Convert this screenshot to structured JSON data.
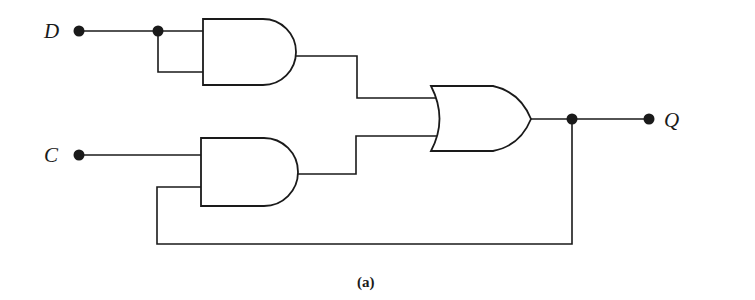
{
  "figure": {
    "caption": "(a)",
    "inputs": [
      {
        "name": "D",
        "label": "D"
      },
      {
        "name": "C",
        "label": "C"
      }
    ],
    "outputs": [
      {
        "name": "Q",
        "label": "Q"
      }
    ],
    "gates": [
      {
        "id": "and1",
        "type": "AND",
        "inputs": [
          "D",
          "D"
        ]
      },
      {
        "id": "and2",
        "type": "AND",
        "inputs": [
          "C",
          "Q"
        ]
      },
      {
        "id": "or1",
        "type": "OR",
        "inputs": [
          "and1",
          "and2"
        ],
        "output": "Q"
      }
    ],
    "feedback": "Q fed back to AND2 lower input"
  },
  "colors": {
    "ink": "#1a1a1a",
    "background": "#ffffff"
  }
}
